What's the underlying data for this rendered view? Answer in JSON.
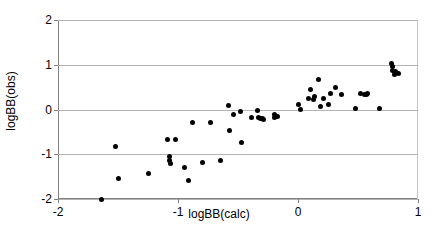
{
  "chart_data": {
    "type": "scatter",
    "title": "",
    "xlabel": "logBB(calc)",
    "ylabel": "logBB(obs)",
    "xlim": [
      -2,
      1
    ],
    "ylim": [
      -2,
      2
    ],
    "xticks": [
      -2,
      -1,
      0,
      1
    ],
    "yticks": [
      -2,
      -1,
      0,
      1,
      2
    ],
    "xtick_labels": [
      "-2",
      "-1",
      "0",
      "1"
    ],
    "ytick_labels": [
      "-2",
      "-1",
      "0",
      "1",
      "2"
    ],
    "grid": "horizontal",
    "legend": "none",
    "marker": "filled-diamond",
    "marker_color": "#000000",
    "series": [
      {
        "name": "logBB observed vs calculated",
        "points": [
          [
            -1.64,
            -2.0
          ],
          [
            -1.52,
            -0.82
          ],
          [
            -1.5,
            -1.55
          ],
          [
            -1.25,
            -1.42
          ],
          [
            -1.09,
            -0.68
          ],
          [
            -1.07,
            -1.06
          ],
          [
            -1.07,
            -1.13
          ],
          [
            -1.06,
            -1.21
          ],
          [
            -1.02,
            -0.68
          ],
          [
            -0.95,
            -1.29
          ],
          [
            -0.91,
            -1.58
          ],
          [
            -0.88,
            -0.28
          ],
          [
            -0.8,
            -1.18
          ],
          [
            -0.73,
            -0.28
          ],
          [
            -0.65,
            -1.15
          ],
          [
            -0.58,
            0.1
          ],
          [
            -0.57,
            -0.47
          ],
          [
            -0.54,
            -0.11
          ],
          [
            -0.48,
            -0.05
          ],
          [
            -0.47,
            -0.73
          ],
          [
            -0.39,
            -0.17
          ],
          [
            -0.34,
            -0.02
          ],
          [
            -0.33,
            -0.18
          ],
          [
            -0.31,
            -0.21
          ],
          [
            -0.3,
            -0.2
          ],
          [
            -0.29,
            -0.22
          ],
          [
            -0.2,
            -0.12
          ],
          [
            -0.2,
            -0.17
          ],
          [
            -0.17,
            -0.15
          ],
          [
            0.0,
            0.12
          ],
          [
            0.02,
            -0.01
          ],
          [
            0.09,
            0.25
          ],
          [
            0.1,
            0.44
          ],
          [
            0.13,
            0.22
          ],
          [
            0.14,
            0.3
          ],
          [
            0.17,
            0.67
          ],
          [
            0.19,
            0.07
          ],
          [
            0.21,
            0.24
          ],
          [
            0.25,
            0.11
          ],
          [
            0.27,
            0.35
          ],
          [
            0.31,
            0.49
          ],
          [
            0.36,
            0.34
          ],
          [
            0.48,
            0.02
          ],
          [
            0.52,
            0.36
          ],
          [
            0.55,
            0.34
          ],
          [
            0.57,
            0.33
          ],
          [
            0.58,
            0.35
          ],
          [
            0.68,
            0.03
          ],
          [
            0.78,
            1.03
          ],
          [
            0.79,
            0.96
          ],
          [
            0.79,
            0.88
          ],
          [
            0.8,
            0.78
          ],
          [
            0.81,
            0.86
          ],
          [
            0.84,
            0.81
          ]
        ]
      }
    ]
  },
  "axes": {
    "x_title": "logBB(calc)",
    "y_title": "logBB(obs)"
  }
}
